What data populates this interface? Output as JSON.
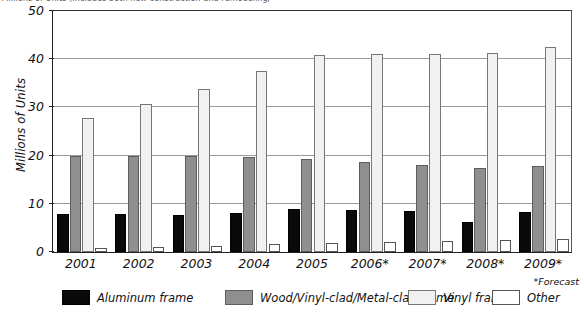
{
  "figure": {
    "source_line": "Millions of Units (includes both new construction and remodeling)",
    "forecast_note": "*Forecast"
  },
  "chart_data": {
    "type": "bar",
    "title": "",
    "xlabel": "",
    "ylabel": "Millions of Units",
    "ylim": [
      0,
      50
    ],
    "yticks": [
      0,
      10,
      20,
      30,
      40,
      50
    ],
    "grid": true,
    "legend_position": "bottom",
    "categories": [
      "2001",
      "2002",
      "2003",
      "2004",
      "2005",
      "2006*",
      "2007*",
      "2008*",
      "2009*"
    ],
    "series": [
      {
        "name": "Aluminum frame",
        "color": "#0a0a0a",
        "values": [
          7.9,
          7.9,
          7.7,
          8.0,
          8.9,
          8.7,
          8.5,
          6.3,
          8.4
        ]
      },
      {
        "name": "Wood/Vinyl-clad/Metal-clad frame",
        "color": "#8f8f8f",
        "values": [
          20.0,
          20.0,
          20.0,
          19.7,
          19.2,
          18.6,
          18.0,
          17.5,
          17.8
        ]
      },
      {
        "name": "Vinyl frame",
        "color": "#f1f1f1",
        "values": [
          27.8,
          30.8,
          33.8,
          37.5,
          40.8,
          41.0,
          41.0,
          41.2,
          42.6
        ]
      },
      {
        "name": "Other",
        "color": "#ffffff",
        "values": [
          0.9,
          1.1,
          1.3,
          1.6,
          1.9,
          2.1,
          2.3,
          2.4,
          2.7
        ]
      }
    ]
  }
}
